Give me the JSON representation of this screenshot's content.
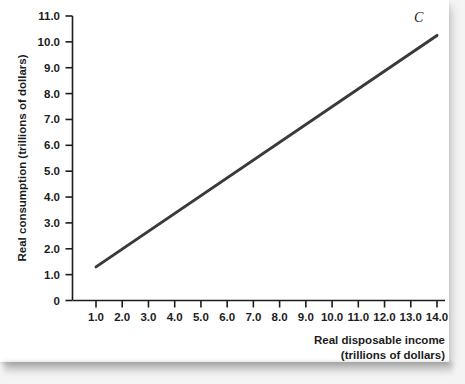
{
  "chart_data": {
    "type": "line",
    "title": "",
    "subtitle": "",
    "xlabel": "Real disposable income",
    "xlabel_line2": "(trillions of dollars)",
    "ylabel": "Real consumption (trillions of dollars)",
    "xlim": [
      0.0,
      14.6
    ],
    "ylim": [
      0.0,
      11.0
    ],
    "grid": false,
    "legend": "none",
    "x_ticks": [
      "1.0",
      "2.0",
      "3.0",
      "4.0",
      "5.0",
      "6.0",
      "7.0",
      "8.0",
      "9.0",
      "10.0",
      "11.0",
      "12.0",
      "13.0",
      "14.0"
    ],
    "x_tick_values": [
      1.0,
      2.0,
      3.0,
      4.0,
      5.0,
      6.0,
      7.0,
      8.0,
      9.0,
      10.0,
      11.0,
      12.0,
      13.0,
      14.0
    ],
    "y_ticks": [
      "0",
      "1.0",
      "2.0",
      "3.0",
      "4.0",
      "5.0",
      "6.0",
      "7.0",
      "8.0",
      "9.0",
      "10.0",
      "11.0"
    ],
    "y_tick_values": [
      0.0,
      1.0,
      2.0,
      3.0,
      4.0,
      5.0,
      6.0,
      7.0,
      8.0,
      9.0,
      10.0,
      11.0
    ],
    "series": [
      {
        "name": "C",
        "label": "C",
        "label_at": {
          "x": 13.3,
          "y": 10.75
        },
        "color": "#3a3a3a",
        "line_width": 3,
        "x": [
          1.0,
          14.0
        ],
        "values": [
          1.3,
          10.25
        ],
        "points": [
          {
            "x": 1.0,
            "y": 1.3
          },
          {
            "x": 14.0,
            "y": 10.25
          }
        ],
        "slope": 0.688,
        "intercept": 0.612
      }
    ],
    "annotations": [
      {
        "text": "C",
        "x": 13.3,
        "y": 10.75,
        "style": "italic-serif"
      }
    ],
    "axis_color": "#1c1c1c"
  },
  "colors": {
    "line": "#3a3a3a",
    "axis": "#1c1c1c",
    "text": "#1c1c1c",
    "page": "#ffffff",
    "background": "#f4f4f4"
  }
}
